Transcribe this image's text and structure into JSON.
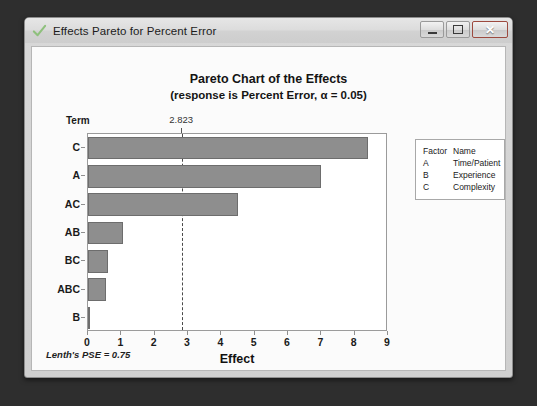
{
  "window": {
    "title": "Effects Pareto for Percent Error",
    "icon": "checkmark-icon",
    "buttons": {
      "minimize": "minimize-icon",
      "maximize": "maximize-icon",
      "close": "✕"
    }
  },
  "chart_data": {
    "type": "bar",
    "orientation": "horizontal",
    "title": "Pareto Chart of the Effects",
    "subtitle": "(response is Percent Error, α = 0.05)",
    "xlabel": "Effect",
    "ylabel": "Term",
    "categories": [
      "C",
      "A",
      "AC",
      "AB",
      "BC",
      "ABC",
      "B"
    ],
    "values": [
      8.4,
      7.0,
      4.5,
      1.05,
      0.6,
      0.55,
      0.05
    ],
    "xlim": [
      0,
      9
    ],
    "xticks": [
      0,
      1,
      2,
      3,
      4,
      5,
      6,
      7,
      8,
      9
    ],
    "xtick_labels": [
      "0",
      "1",
      "2",
      "3",
      "4",
      "5",
      "6",
      "7",
      "8",
      "9"
    ],
    "grid": false,
    "reference_line": {
      "value": 2.823,
      "label": "2.823",
      "style": "dashed"
    },
    "bar_color": "#8e8e8e",
    "bar_border_color": "#6d6d6d",
    "legend": {
      "position": "right",
      "headers": [
        "Factor",
        "Name"
      ],
      "rows": [
        {
          "factor": "A",
          "name": "Time/Patient"
        },
        {
          "factor": "B",
          "name": "Experience"
        },
        {
          "factor": "C",
          "name": "Complexity"
        }
      ]
    },
    "footnote": "Lenth's PSE = 0.75"
  }
}
